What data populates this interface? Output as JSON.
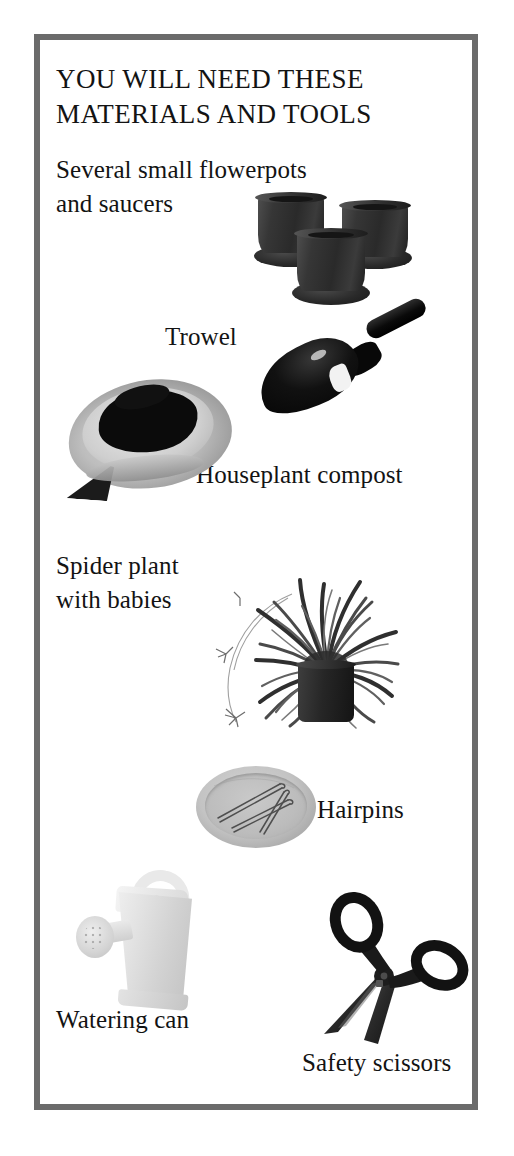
{
  "page": {
    "background_color": "#ffffff",
    "frame_color": "#6b6b6b"
  },
  "title": "YOU WILL NEED THESE\nMATERIALS AND TOOLS",
  "items": [
    {
      "label": "Several small flowerpots\nand saucers",
      "icon": "flowerpots-icon",
      "color": "#2a2a2a"
    },
    {
      "label": "Trowel",
      "icon": "trowel-icon",
      "color": "#0a0a0a"
    },
    {
      "label": "Houseplant compost",
      "icon": "compost-bag-icon",
      "color": "#bdbdbd"
    },
    {
      "label": "Spider plant\nwith babies",
      "icon": "spider-plant-icon",
      "color": "#3a3a3a"
    },
    {
      "label": "Hairpins",
      "icon": "hairpins-in-saucer-icon",
      "color": "#c3c3c3"
    },
    {
      "label": "Watering can",
      "icon": "watering-can-icon",
      "color": "#e2e2e2"
    },
    {
      "label": "Safety scissors",
      "icon": "safety-scissors-icon",
      "color": "#1a1a1a"
    }
  ]
}
